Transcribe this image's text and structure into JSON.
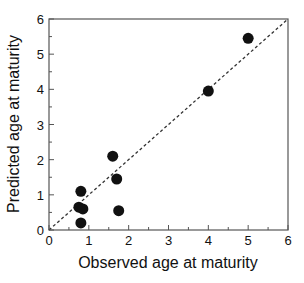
{
  "chart_data": {
    "type": "scatter",
    "title": "",
    "xlabel": "Observed age at maturity",
    "ylabel": "Predicted age at maturity",
    "xlim": [
      0,
      6
    ],
    "ylim": [
      0,
      6
    ],
    "xticks": [
      "0",
      "1",
      "2",
      "3",
      "4",
      "5",
      "6"
    ],
    "yticks": [
      "0",
      "1",
      "2",
      "3",
      "4",
      "5",
      "6"
    ],
    "grid": false,
    "legend": null,
    "reference_line": {
      "type": "1:1 dashed diagonal",
      "from": [
        0,
        0
      ],
      "to": [
        6,
        6
      ]
    },
    "points": [
      {
        "x": 0.75,
        "y": 0.65
      },
      {
        "x": 0.85,
        "y": 0.6
      },
      {
        "x": 0.8,
        "y": 0.2
      },
      {
        "x": 0.8,
        "y": 1.1
      },
      {
        "x": 1.6,
        "y": 2.1
      },
      {
        "x": 1.7,
        "y": 1.45
      },
      {
        "x": 1.75,
        "y": 0.55
      },
      {
        "x": 4.0,
        "y": 3.95
      },
      {
        "x": 5.0,
        "y": 5.45
      }
    ]
  }
}
